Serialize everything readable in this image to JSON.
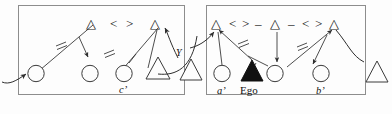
{
  "figure": {
    "type": "syntax-derivation-diagram",
    "panel_count": 2,
    "stroke_color": "#3a3a3a",
    "fill_color": "#111111",
    "background": "#fdfdfd"
  },
  "left_panel": {
    "name": "left-derivation-box",
    "top_row": {
      "symbols": [
        "△",
        "<",
        ">",
        "△"
      ]
    },
    "nodes": {
      "circle_1": "○",
      "circle_2": "○",
      "circle_3": "○",
      "triangle_bottom": "△"
    },
    "labels": {
      "c_prime": "c’"
    },
    "agreement_ticks": 2
  },
  "right_panel": {
    "name": "right-derivation-box",
    "top_row": {
      "symbols": [
        "△",
        "<",
        ">",
        "–",
        "△",
        "–",
        "<",
        ">",
        "△"
      ]
    },
    "nodes": {
      "circle_a": "○",
      "ego_triangle": "▲",
      "circle_mid": "○",
      "circle_b": "○"
    },
    "labels": {
      "a_prime": "a’",
      "ego": "Ego",
      "b_prime": "b’"
    },
    "agreement_ticks": 2
  },
  "between": {
    "link_label": "Y",
    "outer_triangle_left": "△",
    "outer_triangle_right": "△"
  },
  "captions": {
    "left": "",
    "right": ""
  }
}
